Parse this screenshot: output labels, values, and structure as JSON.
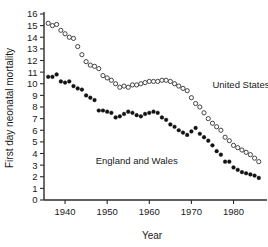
{
  "chart_data": {
    "type": "scatter",
    "title": "",
    "xlabel": "Year",
    "ylabel": "First day neonatal mortality",
    "xlim": [
      1935,
      1987
    ],
    "ylim": [
      0,
      16
    ],
    "grid": false,
    "legend_position": "inline-annotation",
    "x_ticks": [
      1940,
      1950,
      1960,
      1970,
      1980
    ],
    "x_tick_labels": [
      "1940",
      "1950",
      "1960",
      "1970",
      "1980"
    ],
    "y_ticks": [
      0,
      1,
      2,
      3,
      4,
      5,
      6,
      7,
      8,
      9,
      10,
      11,
      12,
      13,
      14,
      15,
      16
    ],
    "y_tick_labels": [
      "0",
      "1",
      "2",
      "3",
      "4",
      "5",
      "6",
      "7",
      "8",
      "9",
      "10",
      "11",
      "12",
      "13",
      "14",
      "15",
      "16"
    ],
    "series": [
      {
        "name": "United States",
        "marker": "open-circle",
        "color": "#3a3a3a",
        "label_x": 1975,
        "label_y": 9.6,
        "x": [
          1936,
          1937,
          1938,
          1939,
          1940,
          1941,
          1942,
          1943,
          1944,
          1945,
          1946,
          1947,
          1948,
          1949,
          1950,
          1951,
          1952,
          1953,
          1954,
          1955,
          1956,
          1957,
          1958,
          1959,
          1960,
          1961,
          1962,
          1963,
          1964,
          1965,
          1966,
          1967,
          1968,
          1969,
          1970,
          1971,
          1972,
          1973,
          1974,
          1975,
          1976,
          1977,
          1978,
          1979,
          1980,
          1981,
          1982,
          1983,
          1984,
          1985,
          1986
        ],
        "y": [
          15.2,
          15.0,
          15.1,
          14.6,
          14.3,
          14.0,
          13.9,
          13.2,
          12.5,
          11.9,
          11.6,
          11.5,
          11.3,
          10.7,
          10.5,
          10.3,
          10.0,
          9.7,
          9.8,
          9.7,
          9.9,
          9.9,
          10.0,
          10.1,
          10.2,
          10.2,
          10.2,
          10.3,
          10.3,
          10.2,
          10.0,
          9.8,
          9.6,
          9.4,
          8.8,
          8.3,
          8.0,
          7.5,
          7.0,
          6.6,
          6.3,
          6.0,
          5.4,
          5.1,
          4.7,
          4.5,
          4.3,
          4.1,
          3.9,
          3.6,
          3.3
        ]
      },
      {
        "name": "England and Wales",
        "marker": "filled-circle",
        "color": "#121212",
        "label_x": 1957,
        "label_y": 3.1,
        "x": [
          1936,
          1937,
          1938,
          1939,
          1940,
          1941,
          1942,
          1943,
          1944,
          1945,
          1946,
          1947,
          1948,
          1949,
          1950,
          1951,
          1952,
          1953,
          1954,
          1955,
          1956,
          1957,
          1958,
          1959,
          1960,
          1961,
          1962,
          1963,
          1964,
          1965,
          1966,
          1967,
          1968,
          1969,
          1970,
          1971,
          1972,
          1973,
          1974,
          1975,
          1976,
          1977,
          1978,
          1979,
          1980,
          1981,
          1982,
          1983,
          1984,
          1985,
          1986
        ],
        "y": [
          10.6,
          10.6,
          10.8,
          10.2,
          10.1,
          10.2,
          9.8,
          9.6,
          9.5,
          9.0,
          8.8,
          8.6,
          7.7,
          7.7,
          7.6,
          7.5,
          7.1,
          7.2,
          7.4,
          7.6,
          7.5,
          7.3,
          7.2,
          7.4,
          7.5,
          7.6,
          7.5,
          7.1,
          6.9,
          6.5,
          6.3,
          6.0,
          5.8,
          5.6,
          5.9,
          6.2,
          5.7,
          5.4,
          5.1,
          4.7,
          4.2,
          3.9,
          3.3,
          3.3,
          2.8,
          2.6,
          2.4,
          2.3,
          2.2,
          2.1,
          1.9
        ]
      }
    ]
  }
}
